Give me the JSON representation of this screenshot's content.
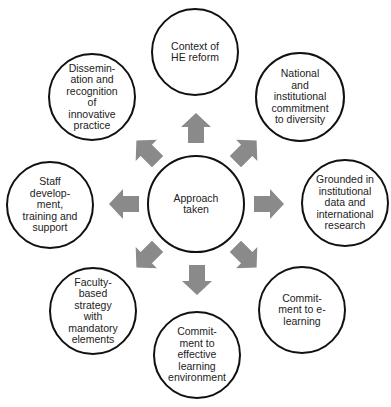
{
  "diagram": {
    "type": "hub-and-spoke",
    "arrow_color": "#8a8a8a",
    "border_color": "#111111",
    "center": {
      "id": "center",
      "label": "Approach\ntaken",
      "cx": 196,
      "cy": 204,
      "r": 49
    },
    "nodes": [
      {
        "id": "top",
        "label": "Context of\nHE reform",
        "cx": 195,
        "cy": 52,
        "r": 44
      },
      {
        "id": "top-right",
        "label": "National\nand\ninstitutional\ncommitment\nto diversity",
        "cx": 300,
        "cy": 97,
        "r": 45
      },
      {
        "id": "right",
        "label": "Grounded in\ninstitutional\ndata and\ninternational\nresearch",
        "cx": 345,
        "cy": 203,
        "r": 44
      },
      {
        "id": "bottom-right",
        "label": "Commit-\nment to e-\nlearning",
        "cx": 302,
        "cy": 310,
        "r": 44
      },
      {
        "id": "bottom",
        "label": "Commit-\nment to\neffective\nlearning\nenvironment",
        "cx": 197,
        "cy": 355,
        "r": 44
      },
      {
        "id": "bottom-left",
        "label": "Faculty-\nbased\nstrategy\nwith\nmandatory\nelements",
        "cx": 93,
        "cy": 311,
        "r": 44
      },
      {
        "id": "left",
        "label": "Staff\ndevelop-\nment,\ntraining and\nsupport",
        "cx": 50,
        "cy": 205,
        "r": 44
      },
      {
        "id": "top-left",
        "label": "Dissemin-\nation and\nrecognition\nof\ninnovative\npractice",
        "cx": 92,
        "cy": 97,
        "r": 44
      }
    ],
    "arrows": [
      {
        "direction": "up",
        "cx": 196,
        "cy": 128,
        "rotate": 0
      },
      {
        "direction": "up-right",
        "cx": 246,
        "cy": 151,
        "rotate": 45
      },
      {
        "direction": "right",
        "cx": 269,
        "cy": 204,
        "rotate": 90
      },
      {
        "direction": "down-right",
        "cx": 246,
        "cy": 257,
        "rotate": 135
      },
      {
        "direction": "down",
        "cx": 197,
        "cy": 280,
        "rotate": 180
      },
      {
        "direction": "down-left",
        "cx": 147,
        "cy": 257,
        "rotate": 225
      },
      {
        "direction": "left",
        "cx": 124,
        "cy": 204,
        "rotate": 270
      },
      {
        "direction": "up-left",
        "cx": 147,
        "cy": 151,
        "rotate": 315
      }
    ]
  }
}
